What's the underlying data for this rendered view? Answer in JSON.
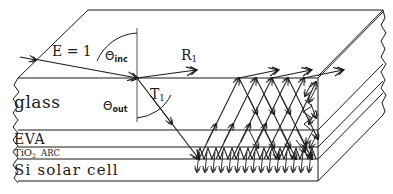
{
  "diagram": {
    "type": "optical-ray-diagram",
    "background_color": "#ffffff",
    "line_color": "#1a1a1a",
    "width": 393,
    "height": 194
  },
  "layers": [
    {
      "id": "glass",
      "label": "glass",
      "y_top": 78,
      "y_bottom": 130,
      "label_x": 14,
      "label_y": 96,
      "font_size": 17
    },
    {
      "id": "eva",
      "label": "EVA",
      "y_top": 130,
      "y_bottom": 147,
      "label_x": 14,
      "label_y": 130,
      "font_size": 14
    },
    {
      "id": "tio2_arc",
      "label_main": "TiO",
      "label_sub": "2",
      "label_tail": "ARC",
      "y_top": 147,
      "y_bottom": 159,
      "label_x": 14,
      "label_y": 146,
      "font_size": 10
    },
    {
      "id": "si_cell",
      "label": "Si solar cell",
      "y_top": 159,
      "y_bottom": 181,
      "label_x": 14,
      "label_y": 160,
      "font_size": 15
    }
  ],
  "ray_labels": [
    {
      "id": "incident",
      "text_main": "E = 1",
      "text_sub": "",
      "x": 52,
      "y": 43
    },
    {
      "id": "reflected-1",
      "text_main": "R",
      "text_sub": "1",
      "x": 181,
      "y": 49
    },
    {
      "id": "transmitted-1",
      "text_main": "T",
      "text_sub": "1",
      "x": 150,
      "y": 88
    }
  ],
  "angle_labels": [
    {
      "id": "theta-incident",
      "symbol": "Θ",
      "sub": "inc",
      "x": 105,
      "y": 51
    },
    {
      "id": "theta-output",
      "symbol": "Θ",
      "sub": "out",
      "x": 103,
      "y": 101
    }
  ],
  "features": {
    "textured_rear_interface": "sawtooth",
    "torn_edges": [
      "left",
      "right"
    ],
    "perspective": "isometric-block",
    "arrowhead_style": "open-double-chevron"
  }
}
